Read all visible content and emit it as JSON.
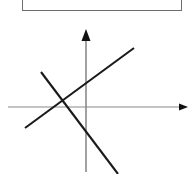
{
  "figure": {
    "title": "",
    "background_color": "#ffffff"
  },
  "answer_box": {
    "name": "empty-answer-box",
    "text": "",
    "border_color": "#6e6e6e",
    "fill_color": "#ffffff"
  },
  "chart_data": {
    "type": "line",
    "title": "",
    "subtitle": "",
    "xlabel": "",
    "ylabel": "",
    "grid": false,
    "legend": null,
    "axes": {
      "x_axis": {
        "label": "",
        "color": "#8a8a8a",
        "stroke_width": 1,
        "arrow": "right",
        "arrow_color": "#111111",
        "start": [
          8,
          107
        ],
        "end": [
          188,
          107
        ],
        "tick_labels": []
      },
      "y_axis": {
        "label": "",
        "color": "#8a8a8a",
        "stroke_width": 1,
        "arrow": "up",
        "arrow_color": "#111111",
        "start": [
          86,
          172
        ],
        "end": [
          86,
          29
        ],
        "tick_labels": []
      },
      "origin": [
        86,
        107
      ],
      "xlim": [
        0,
        191
      ],
      "ylim": [
        0,
        174
      ]
    },
    "series": [
      {
        "name": "rising-line",
        "slope_sign": "positive",
        "color": "#1a1a1a",
        "stroke_width": 2,
        "points": [
          [
            25,
            128
          ],
          [
            134,
            48
          ]
        ]
      },
      {
        "name": "falling-line",
        "slope_sign": "negative",
        "color": "#1a1a1a",
        "stroke_width": 2,
        "points": [
          [
            41,
            72
          ],
          [
            118,
            174
          ]
        ]
      }
    ],
    "annotations": [
      {
        "name": "line-intersection",
        "text": "",
        "point": [
          60,
          103
        ]
      }
    ]
  }
}
